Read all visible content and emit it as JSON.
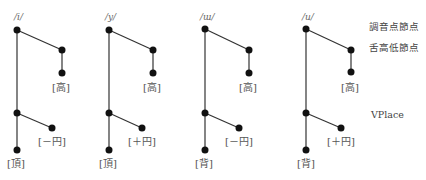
{
  "trees": [
    {
      "phoneme": "/i/",
      "upper_label": "[高]",
      "lower_branch_label": "[－円]",
      "bottom_label": "[頂]"
    },
    {
      "phoneme": "/y/",
      "upper_label": "[高]",
      "lower_branch_label": "[＋円]",
      "bottom_label": "[頂]"
    },
    {
      "phoneme": "/ɯ/",
      "upper_label": "[高]",
      "lower_branch_label": "[－円]",
      "bottom_label": "[背]"
    },
    {
      "phoneme": "/u/",
      "upper_label": "[高]",
      "lower_branch_label": "[＋円]",
      "bottom_label": "[背]"
    }
  ],
  "side_labels": {
    "articulator_node": "調音点節点",
    "tongue_height_node": "舌高低節点",
    "vplace": "VPlace"
  },
  "colors": {
    "line": "#333333",
    "node": "#111111",
    "text": "#555555"
  }
}
